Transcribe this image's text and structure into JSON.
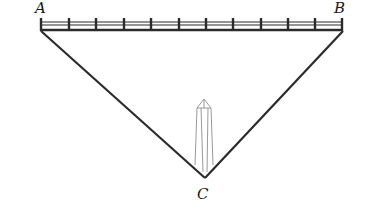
{
  "diagram": {
    "type": "geometry-figure",
    "labels": {
      "A": "A",
      "B": "B",
      "C": "C"
    },
    "points": {
      "A": [
        40,
        30
      ],
      "B": [
        343,
        30
      ],
      "C": [
        205,
        178
      ]
    },
    "railing_posts": 12,
    "colors": {
      "line": "#2b2b2b",
      "monument": "#9a9a9a",
      "background": "#ffffff"
    }
  }
}
